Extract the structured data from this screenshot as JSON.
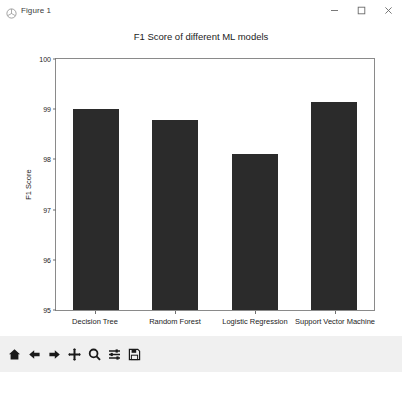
{
  "window": {
    "title": "Figure 1",
    "icon": "matplotlib-icon",
    "controls": [
      {
        "name": "minimize-button",
        "label": "Minimize"
      },
      {
        "name": "maximize-button",
        "label": "Maximize"
      },
      {
        "name": "close-button",
        "label": "Close"
      }
    ]
  },
  "toolbar": {
    "buttons": [
      {
        "name": "home-button",
        "icon": "home-icon",
        "label": "Home"
      },
      {
        "name": "back-button",
        "icon": "arrow-left-icon",
        "label": "Back"
      },
      {
        "name": "forward-button",
        "icon": "arrow-right-icon",
        "label": "Forward"
      },
      {
        "name": "pan-button",
        "icon": "move-icon",
        "label": "Pan"
      },
      {
        "name": "zoom-button",
        "icon": "magnifier-icon",
        "label": "Zoom"
      },
      {
        "name": "subplots-button",
        "icon": "sliders-icon",
        "label": "Configure subplots"
      },
      {
        "name": "save-button",
        "icon": "floppy-disk-icon",
        "label": "Save"
      }
    ]
  },
  "chart_data": {
    "type": "bar",
    "title": "F1 Score of different ML models",
    "xlabel": "",
    "ylabel": "F1 Score",
    "categories": [
      "Decision Tree",
      "Random Forest",
      "Logistic Regression",
      "Support Vector Machine"
    ],
    "values": [
      99.0,
      98.78,
      98.1,
      99.15
    ],
    "ylim": [
      95,
      100
    ],
    "yticks": [
      95,
      96,
      97,
      98,
      99,
      100
    ],
    "grid": false,
    "legend": null,
    "bar_color": "#2b2b2b"
  }
}
